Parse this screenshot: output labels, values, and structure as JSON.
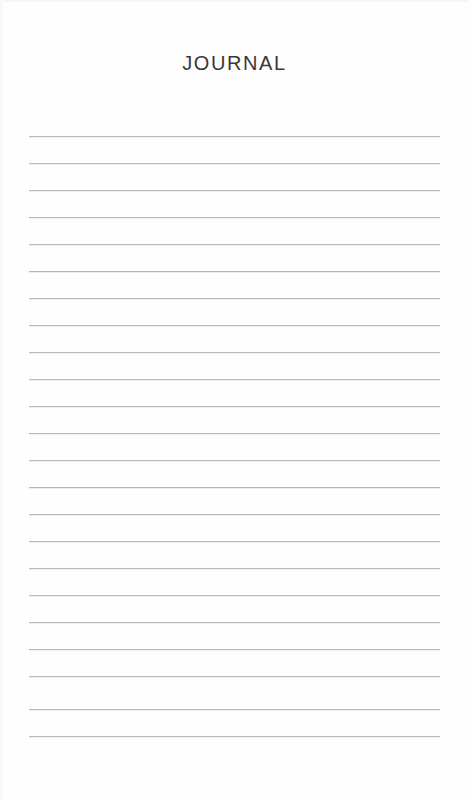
{
  "page": {
    "width": 469,
    "height": 799,
    "background_color": "#fefefe",
    "paper_type": "lined-journal-page"
  },
  "header": {
    "title": "JOURNAL",
    "title_color": "#38383b",
    "title_top": 52,
    "title_align": "center"
  },
  "ruled_area": {
    "line_color": "#b9b9bd",
    "line_left": 29,
    "line_right": 440,
    "line_width": 411,
    "line_spacing": 27,
    "first_line_top": 136,
    "last_line_top": 736,
    "line_count": 23,
    "lines": [
      {
        "index": 1,
        "top": 136,
        "text": ""
      },
      {
        "index": 2,
        "top": 163,
        "text": ""
      },
      {
        "index": 3,
        "top": 190,
        "text": ""
      },
      {
        "index": 4,
        "top": 217,
        "text": ""
      },
      {
        "index": 5,
        "top": 244,
        "text": ""
      },
      {
        "index": 6,
        "top": 271,
        "text": ""
      },
      {
        "index": 7,
        "top": 298,
        "text": ""
      },
      {
        "index": 8,
        "top": 325,
        "text": ""
      },
      {
        "index": 9,
        "top": 352,
        "text": ""
      },
      {
        "index": 10,
        "top": 379,
        "text": ""
      },
      {
        "index": 11,
        "top": 406,
        "text": ""
      },
      {
        "index": 12,
        "top": 433,
        "text": ""
      },
      {
        "index": 13,
        "top": 460,
        "text": ""
      },
      {
        "index": 14,
        "top": 487,
        "text": ""
      },
      {
        "index": 15,
        "top": 514,
        "text": ""
      },
      {
        "index": 16,
        "top": 541,
        "text": ""
      },
      {
        "index": 17,
        "top": 568,
        "text": ""
      },
      {
        "index": 18,
        "top": 595,
        "text": ""
      },
      {
        "index": 19,
        "top": 622,
        "text": ""
      },
      {
        "index": 20,
        "top": 649,
        "text": ""
      },
      {
        "index": 21,
        "top": 676,
        "text": ""
      },
      {
        "index": 22,
        "top": 709,
        "text": ""
      },
      {
        "index": 23,
        "top": 736,
        "text": ""
      }
    ]
  }
}
